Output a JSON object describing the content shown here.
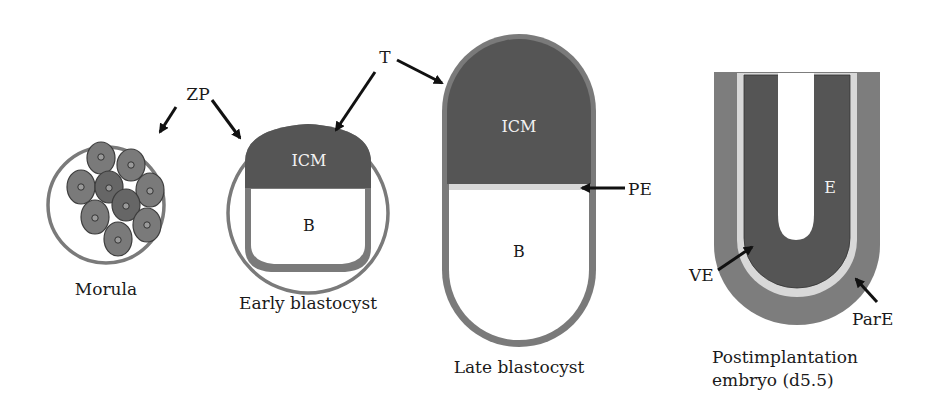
{
  "colors": {
    "dark": "#555555",
    "medium": "#7d7d7d",
    "light": "#d8d8d8",
    "outline": "#777777",
    "arrow": "#111111",
    "background": "#ffffff"
  },
  "stages": [
    {
      "id": "morula",
      "caption": "Morula"
    },
    {
      "id": "early-blastocyst",
      "caption": "Early blastocyst",
      "icm": "ICM",
      "blastocoel": "B"
    },
    {
      "id": "late-blastocyst",
      "caption": "Late blastocyst",
      "icm": "ICM",
      "blastocoel": "B"
    },
    {
      "id": "postimplantation",
      "caption_line1": "Postimplantation",
      "caption_line2": "embryo (d5.5)",
      "epiblast": "E"
    }
  ],
  "annotations": {
    "zp": "ZP",
    "t": "T",
    "pe": "PE",
    "ve": "VE",
    "pare": "ParE"
  }
}
